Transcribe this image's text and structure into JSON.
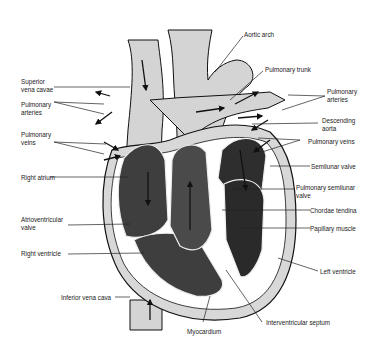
{
  "diagram": {
    "colors": {
      "vessel": "#d4d4d4",
      "chamber": "#3e3e3e",
      "chamber_dark": "#2a2a2a",
      "wall": "#ffffff",
      "line": "#111111"
    },
    "labels": {
      "aortic_arch": "Aortic arch",
      "pulmonary_trunk": "Pulmonary trunk",
      "superior_vena_cavae": "Superior\nvena cavae",
      "pulmonary_arteries_left": "Pulmonary\narteries",
      "pulmonary_arteries_right": "Pulmonary\narteries",
      "pulmonary_veins_left": "Pulmonary\nveins",
      "descending_aorta": "Descending\naorta",
      "pulmonary_veins_right": "Pulmonary veins",
      "semilunar_valve": "Semilunar valve",
      "right_atrium": "Right atrium",
      "pulmonary_semilunar_valve": "Pulmonary semilunar\nvalve",
      "chordae_tendina": "Chordae tendina",
      "atrioventricular_valve": "Atrioventricular\nvalve",
      "papillary_muscle": "Papillary muscle",
      "right_ventricle": "Right ventricle",
      "left_ventricle": "Left ventricle",
      "inferior_vena_cava": "Inferior vena cava",
      "myocardium": "Myocardium",
      "interventricular_septum": "Interventricular septum"
    }
  }
}
